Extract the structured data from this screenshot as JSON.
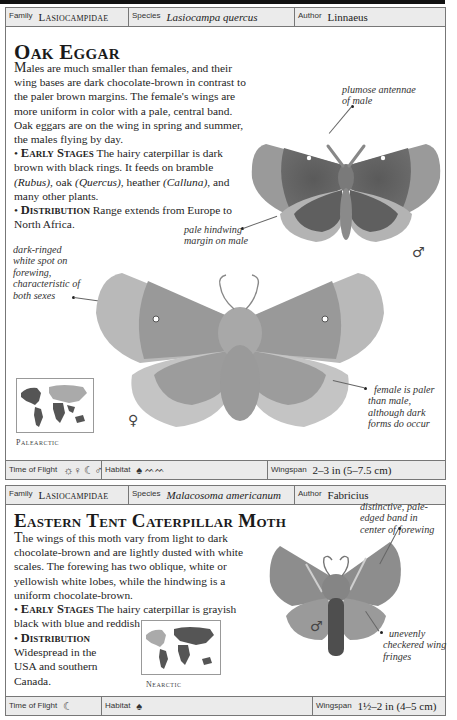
{
  "entries": [
    {
      "header": {
        "family_label": "Family",
        "family": "Lasiocampidae",
        "species_label": "Species",
        "species": "Lasiocampa quercus",
        "author_label": "Author",
        "author": "Linnaeus"
      },
      "title": "Oak Eggar",
      "description": {
        "intro_first": "M",
        "intro": "ales are much smaller than females, and their wing bases are dark chocolate-brown in contrast to the paler brown margins. The female's wings are more uniform in color with a pale, central band. Oak eggars are on the wing in spring and summer, the males flying by day.",
        "early_stages_heading": "Early Stages",
        "early_stages_a": "The hairy caterpillar is dark brown with black rings. It feeds on bramble",
        "plant1": "(Rubus)",
        "sep1": ", oak",
        "plant2": "(Quercus)",
        "sep2": ", heather",
        "plant3": "(Calluna)",
        "early_stages_b": ", and many other plants.",
        "distribution_heading": "Distribution",
        "distribution": "Range extends from Europe to North Africa."
      },
      "annotations": {
        "antennae": "plumose antennae of male",
        "hindwing": "pale hindwing margin on male",
        "spot": "dark-ringed white spot on forewing, characteristic of both sexes",
        "female": "female is paler than male, although dark forms do occur"
      },
      "male_symbol": "♂",
      "female_symbol": "♀",
      "map_label": "Palearctic",
      "footer": {
        "time_label": "Time of Flight",
        "time_icons": "☼♀ ☾♂",
        "habitat_label": "Habitat",
        "habitat_icons": "tree-icon, heath-icon",
        "wingspan_label": "Wingspan",
        "wingspan": "2–3 in (5–7.5 cm)"
      }
    },
    {
      "header": {
        "family_label": "Family",
        "family": "Lasiocampidae",
        "species_label": "Species",
        "species": "Malacosoma americanum",
        "author_label": "Author",
        "author": "Fabricius"
      },
      "title": "Eastern Tent Caterpillar Moth",
      "description": {
        "intro_first": "T",
        "intro": "he wings of this moth vary from light to dark chocolate-brown and are lightly dusted with white scales. The forewing has two oblique, white or yellowish white lobes, while the hindwing is a uniform chocolate-brown.",
        "early_stages_heading": "Early Stages",
        "early_stages": "The hairy caterpillar is grayish black with blue and reddish brown markings.",
        "distribution_heading": "Distribution",
        "distribution": "Widespread in the USA and southern Canada."
      },
      "annotations": {
        "band": "distinctive, pale-edged band in center of forewing",
        "fringes": "unevenly checkered wing fringes"
      },
      "male_symbol": "♂",
      "map_label": "Nearctic",
      "footer": {
        "time_label": "Time of Flight",
        "time_icons": "☾",
        "habitat_label": "Habitat",
        "habitat_icons": "tree-icon",
        "wingspan_label": "Wingspan",
        "wingspan": "1½–2 in (4–5 cm)"
      }
    }
  ]
}
